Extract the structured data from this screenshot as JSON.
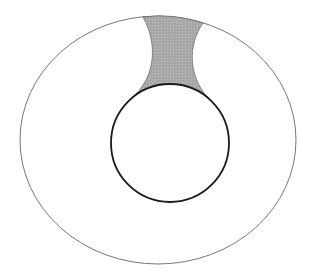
{
  "diagram": {
    "colors": {
      "background": "#ffffff",
      "outer_stroke": "#777777",
      "inner_stroke": "#1a1a1a",
      "shaded_fill": "#a9a9a9",
      "shaded_stroke": "#555555"
    },
    "outer_ellipse": {
      "cx": 158,
      "cy": 140,
      "rx": 138,
      "ry": 124
    },
    "inner_circle": {
      "cx": 170,
      "cy": 143,
      "r": 59
    },
    "shaded_region": {
      "label": ""
    }
  }
}
